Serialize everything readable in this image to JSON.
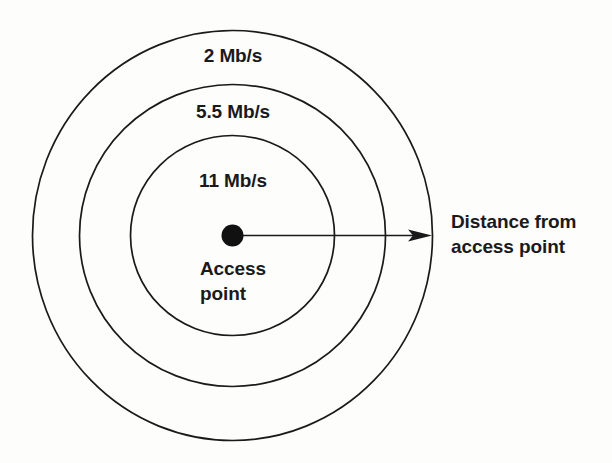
{
  "figure": {
    "background_color": "#fdfdfc",
    "stroke_color": "#1a1a1a",
    "text_color": "#1a1a1a"
  },
  "rings": [
    {
      "id": "outer",
      "rate_label": "2 Mb/s",
      "rate_value": 2,
      "rate_units": "Mb/s",
      "radius_x": 200,
      "radius_y": 205
    },
    {
      "id": "middle",
      "rate_label": "5.5 Mb/s",
      "rate_value": 5.5,
      "rate_units": "Mb/s",
      "radius_x": 153,
      "radius_y": 151
    },
    {
      "id": "inner",
      "rate_label": "11 Mb/s",
      "rate_value": 11,
      "rate_units": "Mb/s",
      "radius_x": 102,
      "radius_y": 100
    }
  ],
  "center": {
    "label_line1": "Access",
    "label_line2": "point",
    "x": 232.5,
    "y": 235.5,
    "dot_radius": 11
  },
  "arrow": {
    "label_line1": "Distance from",
    "label_line2": "access point",
    "start_x": 243,
    "end_x": 432,
    "y": 235.5
  },
  "chart_data": {
    "type": "diagram",
    "categories": [
      "11 Mb/s",
      "5.5 Mb/s",
      "2 Mb/s"
    ],
    "values": [
      11,
      5.5,
      2
    ],
    "xlabel": "Distance from access point",
    "ylabel": "Data rate",
    "annotations": [
      "Access point",
      "Distance from access point"
    ]
  }
}
